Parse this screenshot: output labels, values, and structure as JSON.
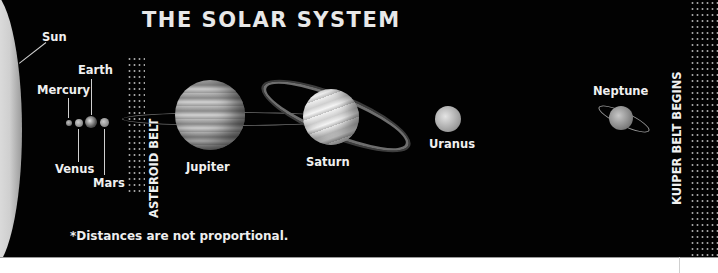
{
  "title": "THE SOLAR SYSTEM",
  "footnote": "*Distances are not proportional.",
  "bodies": {
    "sun": "Sun",
    "mercury": "Mercury",
    "venus": "Venus",
    "earth": "Earth",
    "mars": "Mars",
    "jupiter": "Jupiter",
    "saturn": "Saturn",
    "uranus": "Uranus",
    "neptune": "Neptune"
  },
  "belts": {
    "asteroid": "ASTEROID BELT",
    "kuiper": "KUIPER BELT BEGINS"
  },
  "colors": {
    "background": "#020202",
    "text": "#f0f0f0",
    "sun": "#d8d8d8"
  }
}
